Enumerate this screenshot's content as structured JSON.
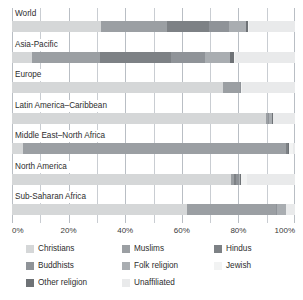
{
  "chart_data": {
    "type": "bar",
    "orientation": "horizontal",
    "stacked": true,
    "title": "",
    "subtitle": "",
    "xlabel": "",
    "ylabel": "",
    "xlim": [
      0,
      100
    ],
    "xtick_labels": [
      "0%",
      "20%",
      "40%",
      "60%",
      "80%",
      "100%"
    ],
    "xticks": [
      0,
      20,
      40,
      60,
      80,
      100
    ],
    "minor_gridlines": [
      10,
      30,
      50,
      70,
      90
    ],
    "grid": true,
    "legend_position": "bottom",
    "categories": [
      "World",
      "Asia-Pacific",
      "Europe",
      "Latin America–Caribbean",
      "Middle East–North Africa",
      "North America",
      "Sub-Saharan Africa"
    ],
    "series": [
      {
        "name": "Christians",
        "color": "#d5d7d8",
        "values": [
          31.5,
          7.0,
          74.5,
          90.0,
          3.8,
          77.4,
          62.0
        ]
      },
      {
        "name": "Muslims",
        "color": "#9b9fa3",
        "values": [
          23.2,
          24.0,
          5.9,
          0.4,
          93.0,
          1.0,
          31.4
        ]
      },
      {
        "name": "Unaffiliated",
        "color": "#e9eaeb",
        "values": [
          16.3,
          21.2,
          18.8,
          7.7,
          0.6,
          17.1,
          3.2
        ]
      },
      {
        "name": "Hindus",
        "color": "#7d8185",
        "values": [
          15.0,
          25.3,
          0.2,
          0.3,
          0.6,
          0.7,
          0.2
        ]
      },
      {
        "name": "Buddhists",
        "color": "#8f9398",
        "values": [
          7.1,
          11.9,
          0.2,
          0.1,
          0.1,
          1.1,
          0.1
        ]
      },
      {
        "name": "Folk religion",
        "color": "#a9adb1",
        "values": [
          5.9,
          9.0,
          0.2,
          1.3,
          0.6,
          1.5,
          3.2
        ]
      },
      {
        "name": "Other religion",
        "color": "#6e7276",
        "values": [
          0.8,
          1.4,
          0.2,
          0.2,
          0.6,
          0.6,
          0.0
        ]
      },
      {
        "name": "Jewish",
        "color": "#f2f3f3",
        "values": [
          0.2,
          0.2,
          0.2,
          0.1,
          1.6,
          1.8,
          0.0
        ]
      }
    ],
    "stack_order": [
      "Christians",
      "Muslims",
      "Hindus",
      "Buddhists",
      "Folk religion",
      "Other religion",
      "Jewish",
      "Unaffiliated"
    ],
    "rows": [
      {
        "label": "World",
        "segments": [
          {
            "name": "Christians",
            "value": 31.5
          },
          {
            "name": "Muslims",
            "value": 23.2
          },
          {
            "name": "Hindus",
            "value": 15.0
          },
          {
            "name": "Buddhists",
            "value": 7.1
          },
          {
            "name": "Folk religion",
            "value": 5.9
          },
          {
            "name": "Other religion",
            "value": 0.8
          },
          {
            "name": "Jewish",
            "value": 0.2
          },
          {
            "name": "Unaffiliated",
            "value": 16.3
          }
        ]
      },
      {
        "label": "Asia-Pacific",
        "segments": [
          {
            "name": "Christians",
            "value": 7.0
          },
          {
            "name": "Muslims",
            "value": 24.0
          },
          {
            "name": "Hindus",
            "value": 25.3
          },
          {
            "name": "Buddhists",
            "value": 11.9
          },
          {
            "name": "Folk religion",
            "value": 9.0
          },
          {
            "name": "Other religion",
            "value": 1.4
          },
          {
            "name": "Jewish",
            "value": 0.2
          },
          {
            "name": "Unaffiliated",
            "value": 21.2
          }
        ]
      },
      {
        "label": "Europe",
        "segments": [
          {
            "name": "Christians",
            "value": 74.5
          },
          {
            "name": "Muslims",
            "value": 5.9
          },
          {
            "name": "Hindus",
            "value": 0.2
          },
          {
            "name": "Buddhists",
            "value": 0.2
          },
          {
            "name": "Folk religion",
            "value": 0.2
          },
          {
            "name": "Other religion",
            "value": 0.0
          },
          {
            "name": "Jewish",
            "value": 0.2
          },
          {
            "name": "Unaffiliated",
            "value": 18.8
          }
        ]
      },
      {
        "label": "Latin America–Caribbean",
        "segments": [
          {
            "name": "Christians",
            "value": 90.0
          },
          {
            "name": "Muslims",
            "value": 0.4
          },
          {
            "name": "Hindus",
            "value": 0.3
          },
          {
            "name": "Buddhists",
            "value": 0.1
          },
          {
            "name": "Folk religion",
            "value": 1.3
          },
          {
            "name": "Other religion",
            "value": 0.2
          },
          {
            "name": "Jewish",
            "value": 0.1
          },
          {
            "name": "Unaffiliated",
            "value": 7.7
          }
        ]
      },
      {
        "label": "Middle East–North Africa",
        "segments": [
          {
            "name": "Christians",
            "value": 3.8
          },
          {
            "name": "Muslims",
            "value": 93.0
          },
          {
            "name": "Hindus",
            "value": 0.6
          },
          {
            "name": "Buddhists",
            "value": 0.1
          },
          {
            "name": "Folk religion",
            "value": 0.2
          },
          {
            "name": "Other religion",
            "value": 0.1
          },
          {
            "name": "Jewish",
            "value": 1.6
          },
          {
            "name": "Unaffiliated",
            "value": 0.6
          }
        ]
      },
      {
        "label": "North America",
        "segments": [
          {
            "name": "Christians",
            "value": 77.4
          },
          {
            "name": "Muslims",
            "value": 1.0
          },
          {
            "name": "Hindus",
            "value": 0.7
          },
          {
            "name": "Buddhists",
            "value": 1.1
          },
          {
            "name": "Folk religion",
            "value": 0.3
          },
          {
            "name": "Other religion",
            "value": 0.6
          },
          {
            "name": "Jewish",
            "value": 1.8
          },
          {
            "name": "Unaffiliated",
            "value": 17.1
          }
        ]
      },
      {
        "label": "Sub-Saharan Africa",
        "segments": [
          {
            "name": "Christians",
            "value": 62.0
          },
          {
            "name": "Muslims",
            "value": 31.4
          },
          {
            "name": "Hindus",
            "value": 0.1
          },
          {
            "name": "Buddhists",
            "value": 0.1
          },
          {
            "name": "Folk religion",
            "value": 3.2
          },
          {
            "name": "Other religion",
            "value": 0.1
          },
          {
            "name": "Jewish",
            "value": 0.0
          },
          {
            "name": "Unaffiliated",
            "value": 3.2
          }
        ]
      }
    ]
  },
  "legend": {
    "items": [
      {
        "label": "Christians",
        "color": "#d5d7d8",
        "col": 0,
        "row": 0
      },
      {
        "label": "Buddhists",
        "color": "#8f9398",
        "col": 0,
        "row": 1
      },
      {
        "label": "Other religion",
        "color": "#6e7276",
        "col": 0,
        "row": 2
      },
      {
        "label": "Muslims",
        "color": "#9b9fa3",
        "col": 1,
        "row": 0
      },
      {
        "label": "Folk religion",
        "color": "#a9adb1",
        "col": 1,
        "row": 1
      },
      {
        "label": "Unaffiliated",
        "color": "#e9eaeb",
        "col": 1,
        "row": 2
      },
      {
        "label": "Hindus",
        "color": "#7d8185",
        "col": 2,
        "row": 0
      },
      {
        "label": "Jewish",
        "color": "#f2f3f3",
        "col": 2,
        "row": 1
      }
    ]
  }
}
